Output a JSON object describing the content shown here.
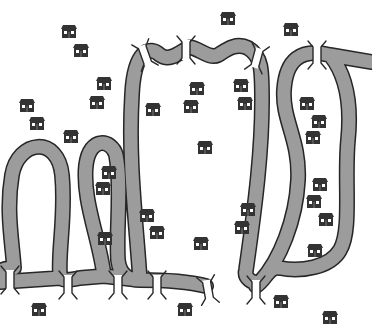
{
  "illustration": {
    "title": "",
    "description": "Winding river with bridges and scattered houses",
    "colors": {
      "background": "#ffffff",
      "river_fill": "#9c9c9c",
      "river_outline": "#262626",
      "house_body": "#333333",
      "house_window": "#ffffff",
      "bridge": "#2a2a2a"
    },
    "houses": [
      {
        "x": 60,
        "y": 25
      },
      {
        "x": 72,
        "y": 44
      },
      {
        "x": 95,
        "y": 77
      },
      {
        "x": 88,
        "y": 96
      },
      {
        "x": 18,
        "y": 99
      },
      {
        "x": 28,
        "y": 117
      },
      {
        "x": 62,
        "y": 130
      },
      {
        "x": 144,
        "y": 103
      },
      {
        "x": 219,
        "y": 12
      },
      {
        "x": 282,
        "y": 23
      },
      {
        "x": 188,
        "y": 82
      },
      {
        "x": 182,
        "y": 100
      },
      {
        "x": 196,
        "y": 141
      },
      {
        "x": 232,
        "y": 79
      },
      {
        "x": 236,
        "y": 97
      },
      {
        "x": 298,
        "y": 97
      },
      {
        "x": 310,
        "y": 115
      },
      {
        "x": 304,
        "y": 131
      },
      {
        "x": 100,
        "y": 166
      },
      {
        "x": 94,
        "y": 182
      },
      {
        "x": 138,
        "y": 209
      },
      {
        "x": 148,
        "y": 226
      },
      {
        "x": 96,
        "y": 232
      },
      {
        "x": 192,
        "y": 237
      },
      {
        "x": 239,
        "y": 203
      },
      {
        "x": 233,
        "y": 221
      },
      {
        "x": 311,
        "y": 178
      },
      {
        "x": 305,
        "y": 195
      },
      {
        "x": 317,
        "y": 213
      },
      {
        "x": 306,
        "y": 244
      },
      {
        "x": 30,
        "y": 303
      },
      {
        "x": 176,
        "y": 303
      },
      {
        "x": 272,
        "y": 295
      },
      {
        "x": 321,
        "y": 311
      }
    ],
    "bridges": [
      {
        "x": 145,
        "y": 55,
        "angle": -20
      },
      {
        "x": 186,
        "y": 50,
        "angle": 0
      },
      {
        "x": 257,
        "y": 58,
        "angle": 15
      },
      {
        "x": 317,
        "y": 55,
        "angle": 0
      },
      {
        "x": 10,
        "y": 280,
        "angle": 0
      },
      {
        "x": 68,
        "y": 285,
        "angle": 0
      },
      {
        "x": 118,
        "y": 285,
        "angle": 0
      },
      {
        "x": 157,
        "y": 285,
        "angle": 0
      },
      {
        "x": 208,
        "y": 290,
        "angle": -10
      },
      {
        "x": 256,
        "y": 290,
        "angle": 0
      }
    ]
  }
}
